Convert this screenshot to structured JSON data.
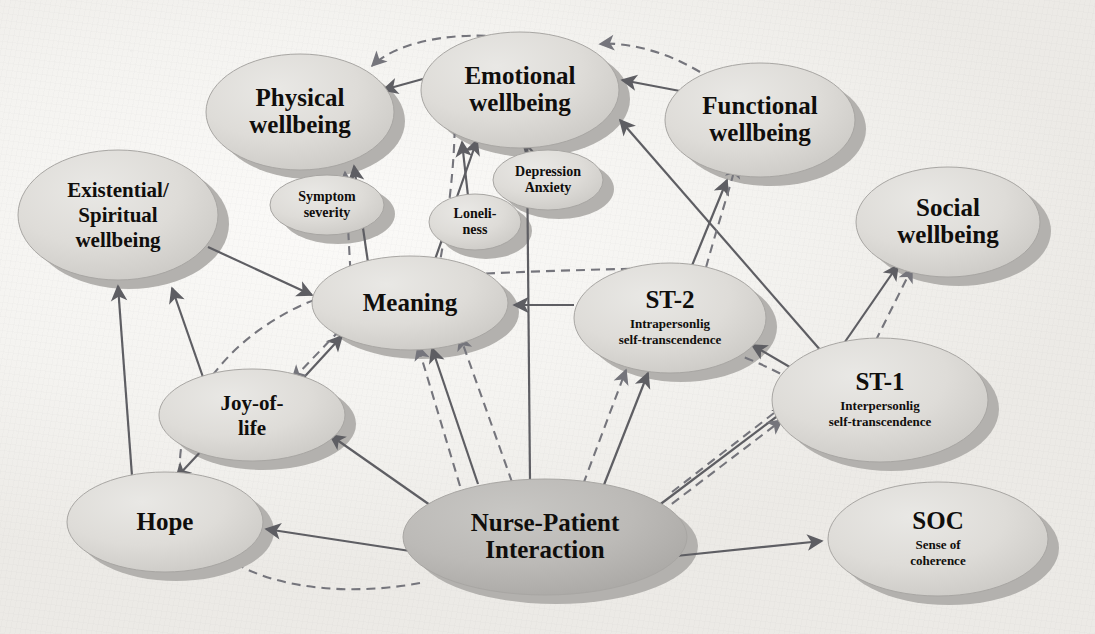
{
  "figure": {
    "type": "concept-model-diagram",
    "background_color": "#f4f3f0",
    "node_fill_light": "#dcdbd7",
    "node_fill_dark": "#b9b8b5",
    "node_edge_color": "#9a9a98",
    "arrow_solid_color": "#5e5e63",
    "arrow_dashed_color": "#75757c"
  },
  "nodes": [
    {
      "id": "physical",
      "label": "Physical\nwellbeing",
      "lines": [
        "Physical",
        "wellbeing"
      ],
      "cx": 300,
      "cy": 112,
      "rx": 94,
      "ry": 58,
      "size": "lg",
      "tone": "light"
    },
    {
      "id": "emotional",
      "label": "Emotional\nwellbeing",
      "lines": [
        "Emotional",
        "wellbeing"
      ],
      "cx": 520,
      "cy": 90,
      "rx": 99,
      "ry": 58,
      "size": "lg",
      "tone": "light"
    },
    {
      "id": "functional",
      "label": "Functional\nwellbeing",
      "lines": [
        "Functional",
        "wellbeing"
      ],
      "cx": 760,
      "cy": 120,
      "rx": 95,
      "ry": 57,
      "size": "lg",
      "tone": "light"
    },
    {
      "id": "existential",
      "label": "Existential/\nSpiritual\nwellbeing",
      "lines": [
        "Existential/",
        "Spiritual",
        "wellbeing"
      ],
      "cx": 118,
      "cy": 215,
      "rx": 100,
      "ry": 65,
      "size": "md",
      "tone": "light"
    },
    {
      "id": "social",
      "label": "Social\nwellbeing",
      "lines": [
        "Social",
        "wellbeing"
      ],
      "cx": 948,
      "cy": 222,
      "rx": 92,
      "ry": 55,
      "size": "lg",
      "tone": "light"
    },
    {
      "id": "symptom",
      "label": "Symptom\nseverity",
      "lines": [
        "Symptom",
        "severity"
      ],
      "cx": 327,
      "cy": 205,
      "rx": 57,
      "ry": 30,
      "size": "sm",
      "tone": "light"
    },
    {
      "id": "depression",
      "label": "Depression\nAnxiety",
      "lines": [
        "Depression",
        "Anxiety"
      ],
      "cx": 548,
      "cy": 180,
      "rx": 55,
      "ry": 30,
      "size": "sm",
      "tone": "light"
    },
    {
      "id": "loneliness",
      "label": "Loneli-\nness",
      "lines": [
        "Loneli-",
        "ness"
      ],
      "cx": 475,
      "cy": 222,
      "rx": 46,
      "ry": 28,
      "size": "sm",
      "tone": "light"
    },
    {
      "id": "meaning",
      "label": "Meaning",
      "lines": [
        "Meaning"
      ],
      "cx": 410,
      "cy": 303,
      "rx": 98,
      "ry": 47,
      "size": "lg",
      "tone": "light"
    },
    {
      "id": "st2",
      "label": "ST-2",
      "lines": [
        "ST-2"
      ],
      "sub": [
        "Intrapersonlig",
        "self-transcendence"
      ],
      "cx": 670,
      "cy": 318,
      "rx": 96,
      "ry": 55,
      "size": "lg",
      "tone": "light"
    },
    {
      "id": "st1",
      "label": "ST-1",
      "lines": [
        "ST-1"
      ],
      "sub": [
        "Interpersonlig",
        "self-transcendence"
      ],
      "cx": 880,
      "cy": 400,
      "rx": 108,
      "ry": 62,
      "size": "lg",
      "tone": "light"
    },
    {
      "id": "joy",
      "label": "Joy-of-\nlife",
      "lines": [
        "Joy-of-",
        "life"
      ],
      "cx": 252,
      "cy": 415,
      "rx": 93,
      "ry": 46,
      "size": "md",
      "tone": "light"
    },
    {
      "id": "hope",
      "label": "Hope",
      "lines": [
        "Hope"
      ],
      "cx": 165,
      "cy": 522,
      "rx": 98,
      "ry": 50,
      "size": "lg",
      "tone": "light"
    },
    {
      "id": "nurse",
      "label": "Nurse-Patient\nInteraction",
      "lines": [
        "Nurse-Patient",
        "Interaction"
      ],
      "cx": 545,
      "cy": 537,
      "rx": 142,
      "ry": 58,
      "size": "lg",
      "tone": "dark"
    },
    {
      "id": "soc",
      "label": "SOC",
      "lines": [
        "SOC"
      ],
      "sub": [
        "Sense of",
        "coherence"
      ],
      "cx": 938,
      "cy": 539,
      "rx": 110,
      "ry": 57,
      "size": "lg",
      "tone": "light"
    }
  ],
  "edges": [
    {
      "from": "emotional",
      "to": "physical",
      "style": "solid"
    },
    {
      "from": "emotional",
      "to": "physical",
      "style": "dashed"
    },
    {
      "from": "functional",
      "to": "emotional",
      "style": "solid"
    },
    {
      "from": "functional",
      "to": "emotional",
      "style": "dashed"
    },
    {
      "from": "symptom",
      "to": "physical",
      "style": "dashed"
    },
    {
      "from": "meaning",
      "to": "physical",
      "style": "solid"
    },
    {
      "from": "meaning",
      "to": "emotional",
      "style": "solid"
    },
    {
      "from": "meaning",
      "to": "emotional",
      "style": "dashed"
    },
    {
      "from": "depression",
      "to": "emotional",
      "style": "solid"
    },
    {
      "from": "loneliness",
      "to": "emotional",
      "style": "solid"
    },
    {
      "from": "existential",
      "to": "meaning",
      "style": "solid"
    },
    {
      "from": "st2",
      "to": "meaning",
      "style": "solid"
    },
    {
      "from": "st2",
      "to": "meaning",
      "style": "dashed"
    },
    {
      "from": "st1",
      "to": "emotional",
      "style": "solid"
    },
    {
      "from": "st1",
      "to": "social",
      "style": "solid"
    },
    {
      "from": "st1",
      "to": "social",
      "style": "dashed"
    },
    {
      "from": "st1",
      "to": "st2",
      "style": "solid"
    },
    {
      "from": "st1",
      "to": "st2",
      "style": "dashed"
    },
    {
      "from": "st2",
      "to": "functional",
      "style": "solid"
    },
    {
      "from": "st2",
      "to": "functional",
      "style": "dashed"
    },
    {
      "from": "joy",
      "to": "meaning",
      "style": "solid"
    },
    {
      "from": "meaning",
      "to": "joy",
      "style": "dashed"
    },
    {
      "from": "joy",
      "to": "hope",
      "style": "solid"
    },
    {
      "from": "hope",
      "to": "existential",
      "style": "solid"
    },
    {
      "from": "joy",
      "to": "existential",
      "style": "solid"
    },
    {
      "from": "nurse",
      "to": "hope",
      "style": "solid"
    },
    {
      "from": "nurse",
      "to": "joy",
      "style": "solid"
    },
    {
      "from": "nurse",
      "to": "meaning",
      "style": "solid"
    },
    {
      "from": "nurse",
      "to": "meaning",
      "style": "dashed"
    },
    {
      "from": "nurse",
      "to": "emotional",
      "style": "solid"
    },
    {
      "from": "nurse",
      "to": "st2",
      "style": "solid"
    },
    {
      "from": "nurse",
      "to": "st2",
      "style": "dashed"
    },
    {
      "from": "nurse",
      "to": "st1",
      "style": "solid"
    },
    {
      "from": "nurse",
      "to": "st1",
      "style": "dashed"
    },
    {
      "from": "nurse",
      "to": "soc",
      "style": "solid"
    },
    {
      "from": "nurse",
      "to": "hope",
      "style": "dashed-arc"
    }
  ]
}
